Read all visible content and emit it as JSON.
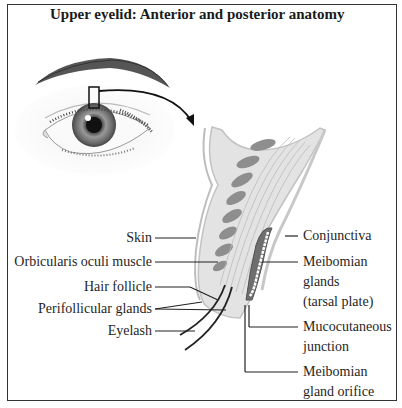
{
  "title": "Upper eyelid: Anterior and posterior anatomy",
  "labels_left": {
    "skin": "Skin",
    "orbicularis": "Orbicularis oculi muscle",
    "hair_follicle": "Hair follicle",
    "perifollicular": "Perifollicular glands",
    "eyelash": "Eyelash"
  },
  "labels_right": {
    "conjunctiva": "Conjunctiva",
    "meibomian_1": "Meibomian",
    "meibomian_2": "glands",
    "meibomian_3": "(tarsal plate)",
    "mucocutaneous_1": "Mucocutaneous",
    "mucocutaneous_2": "junction",
    "orifice_1": "Meibomian",
    "orifice_2": "gland orifice"
  },
  "colors": {
    "frame": "#333333",
    "tissue_light": "#d9d9d9",
    "muscle": "#8c8c8c",
    "gland": "#6e6e6e",
    "leader": "#222222"
  }
}
